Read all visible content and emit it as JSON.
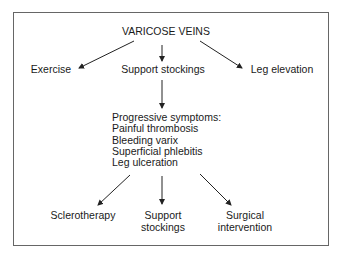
{
  "diagram": {
    "title": "VARICOSE VEINS",
    "first_level": [
      {
        "id": "exercise",
        "label": "Exercise"
      },
      {
        "id": "support-stockings",
        "label": "Support stockings"
      },
      {
        "id": "leg-elevation",
        "label": "Leg elevation"
      }
    ],
    "symptoms": {
      "heading": "Progressive symptoms:",
      "items": [
        "Painful thrombosis",
        "Bleeding varix",
        "Superficial phlebitis",
        "Leg ulceration"
      ]
    },
    "second_level": [
      {
        "id": "sclerotherapy",
        "lines": [
          "Sclerotherapy"
        ]
      },
      {
        "id": "support-stockings-2",
        "lines": [
          "Support",
          "stockings"
        ]
      },
      {
        "id": "surgical-intervention",
        "lines": [
          "Surgical",
          "intervention"
        ]
      }
    ],
    "colors": {
      "line": "#222222",
      "border": "#666666",
      "text": "#1a1a1a"
    }
  }
}
